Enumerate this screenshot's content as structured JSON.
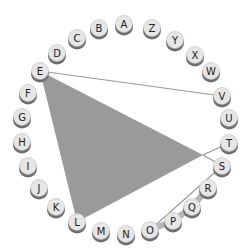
{
  "diagram": {
    "type": "circular-letter-graph",
    "nodes": [
      "A",
      "Z",
      "Y",
      "X",
      "W",
      "V",
      "U",
      "T",
      "S",
      "R",
      "Q",
      "P",
      "O",
      "N",
      "M",
      "L",
      "K",
      "J",
      "I",
      "H",
      "G",
      "F",
      "E",
      "D",
      "C",
      "B"
    ],
    "filled_polygon": {
      "vertices": [
        "E",
        "L",
        "S"
      ],
      "color": "#9a9a9a"
    },
    "thin_lines": [
      [
        "E",
        "V"
      ],
      [
        "T",
        "S-apex"
      ],
      [
        "S",
        "O"
      ]
    ],
    "thick_chain": [
      "O",
      "P",
      "Q",
      "R"
    ],
    "colors": {
      "node_fill": "#e6e6e6",
      "node_shadow": "#6e6e6e",
      "thin_line": "#9a9a9a",
      "thick_line": "#b5b5b5",
      "text": "#222222"
    }
  }
}
